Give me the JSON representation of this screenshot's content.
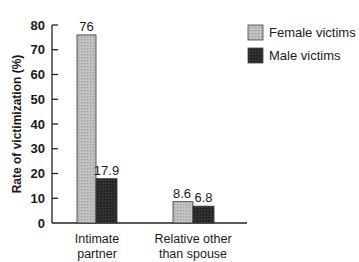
{
  "chart_data": {
    "type": "bar",
    "title": "",
    "xlabel": "",
    "ylabel": "Rate of victimization (%)",
    "ylim": [
      0,
      80
    ],
    "yticks": [
      0,
      10,
      20,
      30,
      40,
      50,
      60,
      70,
      80
    ],
    "grid": false,
    "legend_position": "top-right",
    "categories": [
      "Intimate partner",
      "Relative other than spouse"
    ],
    "category_lines": [
      [
        "Intimate",
        "partner"
      ],
      [
        "Relative other",
        "than spouse"
      ]
    ],
    "series": [
      {
        "name": "Female victims",
        "values": [
          76,
          8.6
        ],
        "labels": [
          "76",
          "8.6"
        ],
        "color": "#b8b8b8"
      },
      {
        "name": "Male victims",
        "values": [
          17.9,
          6.8
        ],
        "labels": [
          "17.9",
          "6.8"
        ],
        "color": "#2a2a2a"
      }
    ]
  }
}
